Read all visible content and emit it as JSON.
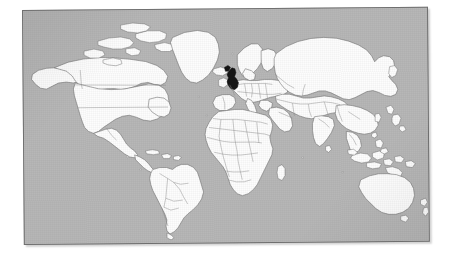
{
  "document": {
    "type": "scanned-figure",
    "title": "World map",
    "page_background": "#ffffff"
  },
  "map": {
    "name": "world-map",
    "projection": "equirectangular",
    "caption": "World map with the United Kingdom highlighted",
    "frame": {
      "border_color": "#6f6f6f",
      "border_width_px": 1,
      "skew_degrees": -0.45,
      "x": 22,
      "y": 10,
      "width": 406,
      "height": 235
    },
    "colors": {
      "ocean": "#b7b7b7",
      "land": "#fdfdfd",
      "border": "#7a7a7a",
      "coastline": "#4a4a4a",
      "highlight": "#151515",
      "page": "#ffffff",
      "shadow": "rgba(0,0,0,0.18)"
    },
    "highlighted_regions": [
      {
        "name": "United Kingdom",
        "fill": "#151515"
      }
    ],
    "labels": [],
    "legend": {
      "visible": false,
      "entries": []
    },
    "graticule": {
      "visible": false
    },
    "landmasses": [
      "North America",
      "South America",
      "Greenland",
      "Europe",
      "Africa",
      "Asia",
      "Russia",
      "Australia",
      "New Zealand",
      "Indonesia",
      "Japan",
      "Madagascar",
      "Iceland",
      "British Isles",
      "Sri Lanka",
      "New Guinea"
    ]
  }
}
